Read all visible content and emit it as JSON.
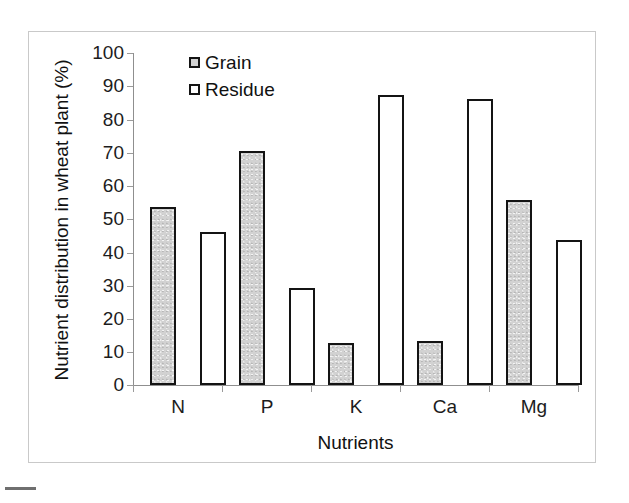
{
  "chart_data": {
    "type": "bar",
    "title": "",
    "categories": [
      "N",
      "P",
      "K",
      "Ca",
      "Mg"
    ],
    "series": [
      {
        "name": "Grain",
        "values": [
          53.6,
          70.5,
          12.6,
          13.3,
          55.7
        ],
        "color": "#d2d2d2"
      },
      {
        "name": "Residue",
        "values": [
          46.0,
          29.2,
          87.3,
          86.2,
          43.7
        ],
        "color": "#ffffff"
      }
    ],
    "xlabel": "Nutrients",
    "ylabel": "Nutrient distribution in wheat plant (%)",
    "ylim": [
      0,
      100
    ],
    "ytick_labels": [
      "100",
      "90",
      "80",
      "70",
      "60",
      "50",
      "40",
      "30",
      "20",
      "10",
      "0"
    ],
    "ytick_values": [
      100,
      90,
      80,
      70,
      60,
      50,
      40,
      30,
      20,
      10,
      0
    ],
    "grid": false,
    "legend_position": "top-left-inside",
    "legend": [
      {
        "label": "Grain",
        "swatch": "filled-gray"
      },
      {
        "label": "Residue",
        "swatch": "outlined-white"
      }
    ],
    "bar_outline_color": "#141414",
    "axis_color": "#8f8f8f"
  }
}
